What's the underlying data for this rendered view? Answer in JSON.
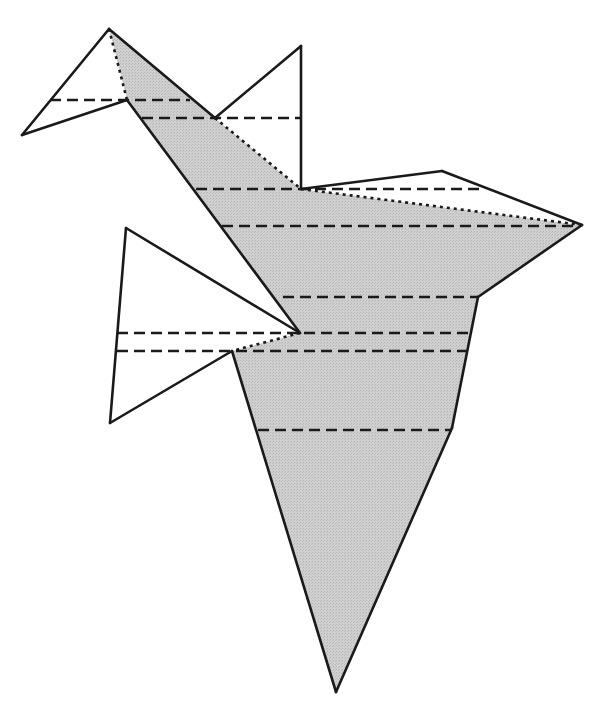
{
  "figure": {
    "colors": {
      "stroke": "#1a1a1a",
      "fill_shaded": "#c9c9c9",
      "fill_plain": "#ffffff",
      "background": "#ffffff"
    },
    "shaded_polygon": [
      [
        109,
        29
      ],
      [
        215,
        118
      ],
      [
        301,
        189
      ],
      [
        582,
        225
      ],
      [
        478,
        297
      ],
      [
        452,
        428
      ],
      [
        336,
        692
      ],
      [
        232,
        351
      ],
      [
        300,
        333
      ],
      [
        127,
        100
      ]
    ],
    "white_polygons": [
      {
        "name": "head-flap",
        "points": [
          [
            109,
            29
          ],
          [
            22,
            135
          ],
          [
            127,
            100
          ]
        ]
      },
      {
        "name": "upper-right-flap",
        "points": [
          [
            215,
            118
          ],
          [
            301,
            46
          ],
          [
            301,
            189
          ]
        ]
      },
      {
        "name": "wing-right-flap",
        "points": [
          [
            301,
            189
          ],
          [
            442,
            171
          ],
          [
            582,
            225
          ]
        ]
      },
      {
        "name": "lower-left-flap",
        "points": [
          [
            126,
            228
          ],
          [
            300,
            333
          ],
          [
            232,
            351
          ],
          [
            110,
            423
          ]
        ]
      }
    ],
    "dashed_lines": [
      {
        "y": 100,
        "x1": 50,
        "x2": 190
      },
      {
        "y": 118,
        "x1": 142,
        "x2": 300
      },
      {
        "y": 189,
        "x1": 196,
        "x2": 480
      },
      {
        "y": 226,
        "x1": 222,
        "x2": 578
      },
      {
        "y": 297,
        "x1": 283,
        "x2": 478
      },
      {
        "y": 333,
        "x1": 117,
        "x2": 470
      },
      {
        "y": 351,
        "x1": 117,
        "x2": 467
      },
      {
        "y": 430,
        "x1": 258,
        "x2": 452
      }
    ],
    "dotted_lines": [
      [
        [
          109,
          29
        ],
        [
          127,
          100
        ]
      ],
      [
        [
          215,
          118
        ],
        [
          301,
          189
        ]
      ],
      [
        [
          301,
          189
        ],
        [
          582,
          225
        ]
      ],
      [
        [
          300,
          333
        ],
        [
          232,
          351
        ]
      ]
    ],
    "caption_cropped": "(caption text cropped at bottom edge — illegible)"
  }
}
